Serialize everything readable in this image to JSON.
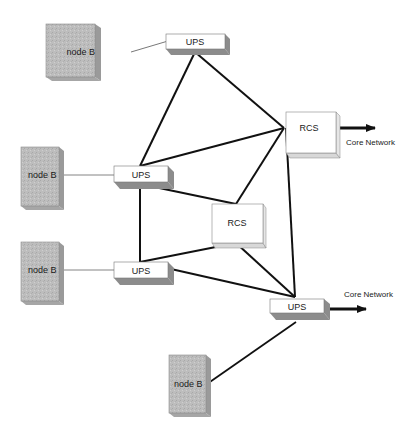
{
  "diagram": {
    "nodes": [
      {
        "id": "nodeb1",
        "type": "node-b",
        "label": "node B"
      },
      {
        "id": "nodeb2",
        "type": "node-b",
        "label": "node B"
      },
      {
        "id": "nodeb3",
        "type": "node-b",
        "label": "node B"
      },
      {
        "id": "nodeb4",
        "type": "node-b",
        "label": "node B"
      },
      {
        "id": "ups1",
        "type": "ups",
        "label": "UPS"
      },
      {
        "id": "ups2",
        "type": "ups",
        "label": "UPS"
      },
      {
        "id": "ups3",
        "type": "ups",
        "label": "UPS"
      },
      {
        "id": "ups4",
        "type": "ups",
        "label": "UPS"
      },
      {
        "id": "rcs1",
        "type": "rcs",
        "label": "RCS"
      },
      {
        "id": "rcs2",
        "type": "rcs",
        "label": "RCS"
      }
    ],
    "access_links": [
      {
        "from": "nodeb1",
        "to": "ups1"
      },
      {
        "from": "nodeb2",
        "to": "ups2"
      },
      {
        "from": "nodeb3",
        "to": "ups3"
      },
      {
        "from": "nodeb4",
        "to": "ups4"
      }
    ],
    "core_links": [
      {
        "from": "ups1",
        "to": "rcs1"
      },
      {
        "from": "ups1",
        "to": "ups2"
      },
      {
        "from": "ups2",
        "to": "rcs1"
      },
      {
        "from": "ups2",
        "to": "rcs2"
      },
      {
        "from": "ups2",
        "to": "ups3"
      },
      {
        "from": "rcs2",
        "to": "rcs1"
      },
      {
        "from": "ups3",
        "to": "rcs2"
      },
      {
        "from": "ups3",
        "to": "ups4"
      },
      {
        "from": "rcs2",
        "to": "ups4"
      },
      {
        "from": "rcs1",
        "to": "ups4"
      }
    ],
    "external_links": [
      {
        "from": "rcs1",
        "label": "Core Network"
      },
      {
        "from": "ups4",
        "label": "Core Network"
      }
    ],
    "colors": {
      "node_b_fill": "#b8b8b8",
      "node_b_side": "#9a9a9a",
      "box_fill": "#ffffff",
      "box_shadow": "#8c8c8c",
      "link": "#111111",
      "access_link": "#555555"
    }
  }
}
